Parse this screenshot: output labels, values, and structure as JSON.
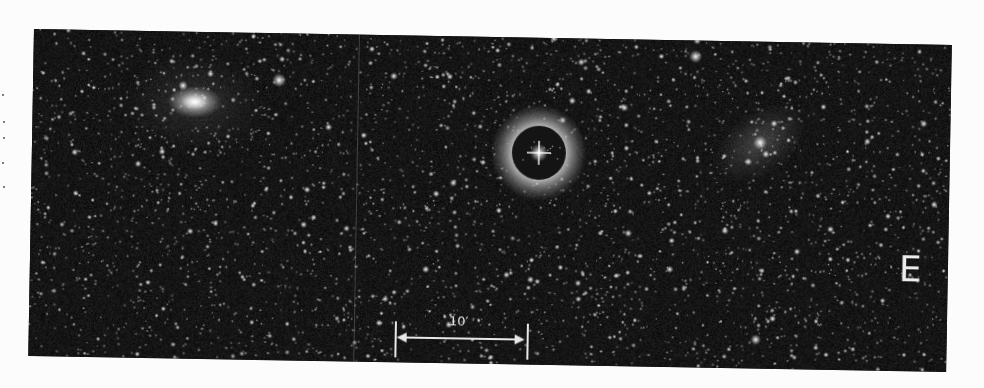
{
  "figure": {
    "type": "astronomical-photographic-plate",
    "direction_label": "E",
    "scale_bar": {
      "label": "10′",
      "length_px": 134
    }
  },
  "starfield": {
    "seed": 1337,
    "faint_count": 2600,
    "medium_count": 520,
    "bright_count": 70,
    "background": "#0c0c0c"
  },
  "features": {
    "bright_star_with_halo": {
      "x": 507,
      "y": 115,
      "inner_radius": 27,
      "ring_radius": 38
    },
    "left_galaxy": {
      "x": 162,
      "y": 70,
      "rx": 17,
      "ry": 10
    },
    "right_galaxy": {
      "x": 728,
      "y": 101,
      "rx": 22,
      "ry": 20
    },
    "bright_stars": [
      {
        "x": 246,
        "y": 47,
        "r": 3.2
      },
      {
        "x": 662,
        "y": 16,
        "r": 3.0
      },
      {
        "x": 150,
        "y": 54,
        "r": 2.2
      },
      {
        "x": 727,
        "y": 298,
        "r": 2.4
      }
    ]
  }
}
